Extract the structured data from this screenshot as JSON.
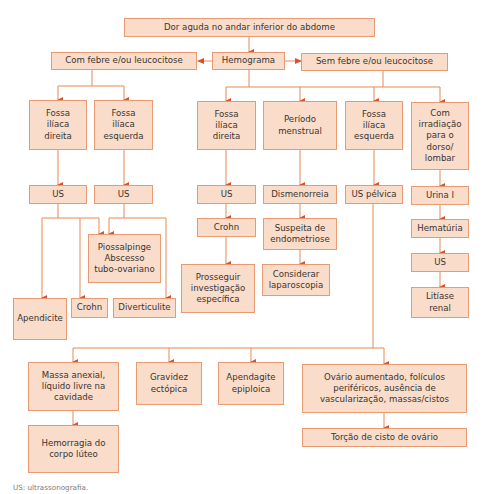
{
  "title": "Dor aguda no andar inferior do abdome",
  "colors": {
    "box_fill": "#f9dcc9",
    "box_border": "#e89a72",
    "line": "#e58a55",
    "arrow": "#d9522a",
    "text": "#3b3531"
  },
  "nodes": {
    "root": "Dor aguda no andar inferior do abdome",
    "hemograma": "Hemograma",
    "com_febre": "Com febre e/ou leucocitose",
    "sem_febre": "Sem febre e/ou leucocitose",
    "cf_fid": "Fossa\nilíaca\ndireita",
    "cf_fie": "Fossa\nilíaca\nesquerda",
    "cf_us1": "US",
    "cf_us2": "US",
    "piossalpinge": "Piossalpinge\nAbscesso\ntubo-ovariano",
    "apendicite": "Apendicite",
    "crohn_left": "Crohn",
    "diverticulite": "Diverticulite",
    "sf_fid": "Fossa\nilíaca\ndireita",
    "periodo": "Período\nmenstrual",
    "sf_fie": "Fossa\nilíaca\nesquerda",
    "irradiacao": "Com\nirradiação\npara o\ndorso/\nlombar",
    "sf_us": "US",
    "dismenorreia": "Dismenorreia",
    "us_pelvica": "US pélvica",
    "urina": "Urina I",
    "crohn_mid": "Crohn",
    "suspeita": "Suspeita de\nendometriose",
    "hematuria": "Hematúria",
    "prosseguir": "Prosseguir\ninvestigação\nespecífica",
    "considerar": "Considerar\nlaparoscopia",
    "us_right": "US",
    "litiase": "Litíase\nrenal",
    "massa": "Massa anexial,\nlíquido livre na\ncavidade",
    "gravidez": "Gravidez\nectópica",
    "apendagite": "Apendagite\nepiploica",
    "ovario": "Ovário aumentado, folículos\nperiféricos, ausência de\nvascularização, massas/cistos",
    "hemorragia": "Hemorragia do\ncorpo lúteo",
    "torcao": "Torção de cisto de ovário"
  },
  "footnote": "US: ultrassonografia."
}
